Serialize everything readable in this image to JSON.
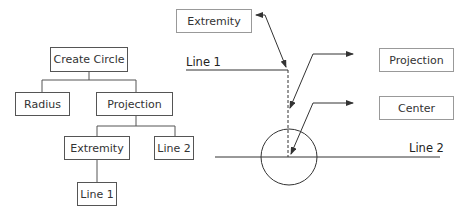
{
  "tree": {
    "root": "Create Circle",
    "level1": [
      "Radius",
      "Projection"
    ],
    "level2": [
      "Extremity",
      "Line 2"
    ],
    "level3": [
      "Line 1"
    ]
  },
  "illustration": {
    "callouts": {
      "extremity": "Extremity",
      "projection": "Projection",
      "center": "Center"
    },
    "line_labels": {
      "line1": "Line 1",
      "line2": "Line 2"
    }
  }
}
